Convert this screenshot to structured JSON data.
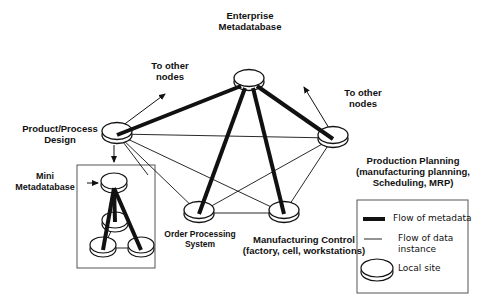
{
  "diagram": {
    "nodes": {
      "enterprise": {
        "label_line1": "Enterprise",
        "label_line2": "Metadatabase"
      },
      "product_design": {
        "label_line1": "Product/Process",
        "label_line2": "Design"
      },
      "production_planning": {
        "label_line1": "Production Planning",
        "label_line2": "(manufacturing planning,",
        "label_line3": "Scheduling, MRP)"
      },
      "order_processing": {
        "label_line1": "Order Processing",
        "label_line2": "System"
      },
      "manufacturing_control": {
        "label_line1": "Manufacturing Control",
        "label_line2": "(factory, cell, workstations)"
      },
      "mini_metadatabase": {
        "label_line1": "Mini",
        "label_line2": "Metadatabase"
      }
    },
    "arrows": {
      "left_other_nodes": {
        "label_line1": "To other",
        "label_line2": "nodes"
      },
      "right_other_nodes": {
        "label_line1": "To other",
        "label_line2": "nodes"
      }
    },
    "legend": {
      "metadata_flow": "Flow of metadata",
      "data_flow_line1": "Flow of data",
      "data_flow_line2": "instance",
      "local_site": "Local site"
    },
    "edges": {
      "metadata": [
        [
          "enterprise",
          "product_design"
        ],
        [
          "enterprise",
          "production_planning"
        ],
        [
          "enterprise",
          "order_processing"
        ],
        [
          "enterprise",
          "manufacturing_control"
        ],
        [
          "mini_top",
          "mini_bottom_left"
        ],
        [
          "mini_top",
          "mini_middle"
        ],
        [
          "mini_top",
          "mini_bottom_right"
        ]
      ],
      "data_instance": [
        [
          "product_design",
          "production_planning"
        ],
        [
          "product_design",
          "order_processing"
        ],
        [
          "product_design",
          "manufacturing_control"
        ],
        [
          "production_planning",
          "order_processing"
        ],
        [
          "production_planning",
          "manufacturing_control"
        ],
        [
          "order_processing",
          "manufacturing_control"
        ],
        [
          "mini_bottom_left",
          "mini_bottom_right"
        ],
        [
          "mini_middle",
          "mini_bottom_left"
        ]
      ]
    },
    "colors": {
      "line": "#111111",
      "box_border": "#555555",
      "background": "#ffffff"
    }
  }
}
